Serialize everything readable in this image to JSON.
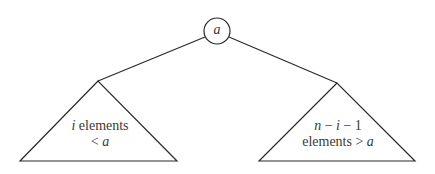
{
  "diagram": {
    "title": "",
    "root": {
      "label": "a"
    },
    "left_subtree": {
      "line1_var": "i",
      "line1_text": " elements",
      "line2_op": "< ",
      "line2_var": "a"
    },
    "right_subtree": {
      "line1_expr_n": "n",
      "line1_expr_rest1": " − ",
      "line1_expr_i": "i",
      "line1_expr_rest2": " − 1",
      "line2_text": "elements > ",
      "line2_var": "a"
    }
  }
}
